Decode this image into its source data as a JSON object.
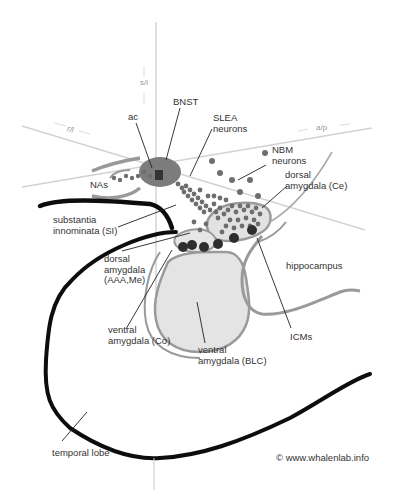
{
  "diagram": {
    "axes": {
      "vertical": "s/i",
      "lateral": "r/l",
      "anteroposterior": "a/p"
    },
    "labels": {
      "bnst": "BNST",
      "ac": "ac",
      "slea": "SLEA\nneurons",
      "nbm": "NBM\nneurons",
      "nas": "NAs",
      "dorsal_ce": "dorsal\namygdala (Ce)",
      "si": "substantia\ninnominata (SI)",
      "dorsal_aaa": "dorsal\namygdala\n(AAA,Me)",
      "hippocampus": "hippocampus",
      "ventral_co": "ventral\namygdala (Co)",
      "ventral_blc": "ventral\namygdala (BLC)",
      "icms": "ICMs",
      "temporal_lobe": "temporal lobe"
    },
    "credit": "© www.whalenlab.info",
    "colors": {
      "axis": "#cfcfcf",
      "outline_gray": "#9a9a9a",
      "region_fill": "#e2e2e2",
      "neuron_dots": "#6e6e6e",
      "icm_dots": "#2e2e2e",
      "bnst_fill": "#7a7a7a",
      "thick_outline": "#0d0d0d"
    }
  }
}
